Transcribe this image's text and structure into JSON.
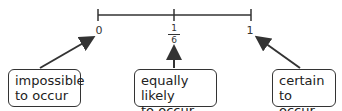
{
  "number_line": {
    "ticks": [
      {
        "label": "0",
        "position": 0
      },
      {
        "label_numerator": "1",
        "label_denominator": "6",
        "position": 0.5
      },
      {
        "label": "1",
        "position": 1
      }
    ]
  },
  "callouts": [
    {
      "text_line1": "impossible",
      "text_line2": "to occur",
      "points_to": "0"
    },
    {
      "text_line1": "equally likely",
      "text_line2": "to occur",
      "points_to": "1/6"
    },
    {
      "text_line1": "certain to",
      "text_line2": "occur",
      "points_to": "1"
    }
  ],
  "colors": {
    "line": "#333333",
    "text": "#222222",
    "background": "#ffffff"
  }
}
